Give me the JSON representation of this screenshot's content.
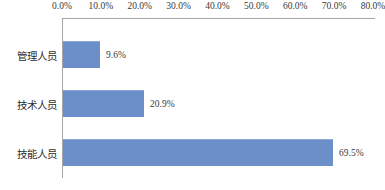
{
  "chart_data": {
    "type": "bar",
    "orientation": "horizontal",
    "title": "",
    "subtitle": "",
    "xlabel": "",
    "ylabel": "",
    "categories": [
      "管理人员",
      "技术人员",
      "技能人员"
    ],
    "values": [
      9.6,
      20.9,
      69.5
    ],
    "value_labels": [
      "9.6%",
      "20.9%",
      "69.5%"
    ],
    "series": [
      {
        "name": "",
        "values": [
          9.6,
          20.9,
          69.5
        ],
        "color": "#6d8fc9"
      }
    ],
    "xlim": [
      0,
      80
    ],
    "xticks": [
      0,
      10,
      20,
      30,
      40,
      50,
      60,
      70,
      80
    ],
    "xtick_labels": [
      "0.0%",
      "10.0%",
      "20.0%",
      "30.0%",
      "40.0%",
      "50.0%",
      "60.0%",
      "70.0%",
      "80.0%"
    ],
    "x_axis_position": "top",
    "grid": false,
    "legend": false,
    "legend_position": "none",
    "bar_color": "#6d8fc9",
    "axis_line_color": "#a6a6a6",
    "background_color": "#ffffff",
    "text_color": "#3a3a3a"
  }
}
